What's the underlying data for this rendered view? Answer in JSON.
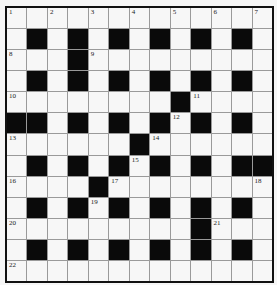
{
  "puzzle": {
    "rows": 13,
    "cols": 13,
    "colors": {
      "black_cell": "#0a0a0a",
      "white_cell": "#f7f7f7",
      "border": "#111111",
      "grid_line": "#9a9a9a"
    },
    "layout": [
      "1.2.3.4.5.6.7",
      ".#.#.#.#.#.#.",
      "8..#9........",
      ".#.#.#.#.#.#.",
      "10......#11...",
      "##.#.#.12#.#.",
      "13....#14.....",
      ".#.#.#15#.#.##",
      "16...#17......18",
      ".#.#19#.#.#.#.",
      "20.......#21..",
      ".#.#.#.#.#.#.",
      "22............"
    ],
    "black_cells": [
      [
        1,
        1
      ],
      [
        1,
        3
      ],
      [
        1,
        5
      ],
      [
        1,
        7
      ],
      [
        1,
        9
      ],
      [
        1,
        11
      ],
      [
        2,
        3
      ],
      [
        3,
        1
      ],
      [
        3,
        3
      ],
      [
        3,
        5
      ],
      [
        3,
        7
      ],
      [
        3,
        9
      ],
      [
        3,
        11
      ],
      [
        4,
        8
      ],
      [
        5,
        0
      ],
      [
        5,
        1
      ],
      [
        5,
        3
      ],
      [
        5,
        5
      ],
      [
        5,
        7
      ],
      [
        5,
        9
      ],
      [
        5,
        11
      ],
      [
        6,
        6
      ],
      [
        7,
        1
      ],
      [
        7,
        3
      ],
      [
        7,
        5
      ],
      [
        7,
        7
      ],
      [
        7,
        9
      ],
      [
        7,
        11
      ],
      [
        7,
        12
      ],
      [
        8,
        4
      ],
      [
        9,
        1
      ],
      [
        9,
        3
      ],
      [
        9,
        5
      ],
      [
        9,
        7
      ],
      [
        9,
        9
      ],
      [
        9,
        11
      ],
      [
        10,
        9
      ],
      [
        11,
        1
      ],
      [
        11,
        3
      ],
      [
        11,
        5
      ],
      [
        11,
        7
      ],
      [
        11,
        9
      ],
      [
        11,
        11
      ]
    ],
    "numbers": [
      {
        "n": "1",
        "r": 0,
        "c": 0
      },
      {
        "n": "2",
        "r": 0,
        "c": 2
      },
      {
        "n": "3",
        "r": 0,
        "c": 4
      },
      {
        "n": "4",
        "r": 0,
        "c": 6
      },
      {
        "n": "5",
        "r": 0,
        "c": 8
      },
      {
        "n": "6",
        "r": 0,
        "c": 10
      },
      {
        "n": "7",
        "r": 0,
        "c": 12
      },
      {
        "n": "8",
        "r": 2,
        "c": 0
      },
      {
        "n": "9",
        "r": 2,
        "c": 4
      },
      {
        "n": "10",
        "r": 4,
        "c": 0
      },
      {
        "n": "11",
        "r": 4,
        "c": 9
      },
      {
        "n": "12",
        "r": 5,
        "c": 8
      },
      {
        "n": "13",
        "r": 6,
        "c": 0
      },
      {
        "n": "14",
        "r": 6,
        "c": 7
      },
      {
        "n": "15",
        "r": 7,
        "c": 6
      },
      {
        "n": "16",
        "r": 8,
        "c": 0
      },
      {
        "n": "17",
        "r": 8,
        "c": 5
      },
      {
        "n": "18",
        "r": 8,
        "c": 12
      },
      {
        "n": "19",
        "r": 9,
        "c": 4
      },
      {
        "n": "20",
        "r": 10,
        "c": 0
      },
      {
        "n": "21",
        "r": 10,
        "c": 10
      },
      {
        "n": "22",
        "r": 12,
        "c": 0
      }
    ]
  }
}
